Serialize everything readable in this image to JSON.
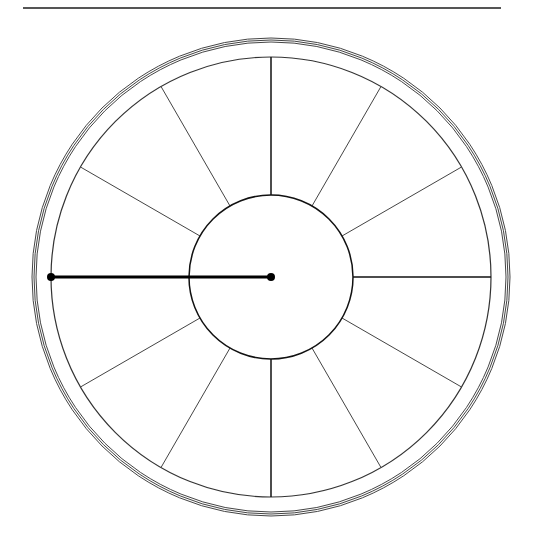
{
  "diagram": {
    "type": "house-wheel",
    "center": [
      271,
      277
    ],
    "radii": {
      "inner": 82,
      "wheel": 220,
      "outer_ring_inner": 234,
      "outer_ring_outer": 238
    },
    "spokes": 12,
    "spoke_angles_deg": [
      0,
      30,
      60,
      90,
      120,
      150,
      180,
      210,
      240,
      270,
      300,
      330
    ],
    "hand": {
      "from": [
        271,
        277
      ],
      "to": [
        51,
        277
      ]
    },
    "colors": {
      "line": "#222222",
      "hand": "#000000",
      "background": "#ffffff"
    }
  },
  "caption": ""
}
